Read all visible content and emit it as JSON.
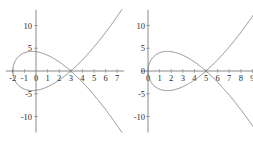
{
  "figure": {
    "background_color": "#ffffff",
    "curve_color": "#7a7a7a",
    "axis_color": "#8a8a8a",
    "label_color": "#2a2a2a"
  },
  "chart_data": [
    {
      "type": "line",
      "name": "left-plot",
      "title": "",
      "xlabel": "",
      "ylabel": "",
      "xlim": [
        -2.6,
        7.6
      ],
      "ylim": [
        -13.5,
        13.5
      ],
      "grid": false,
      "legend": false,
      "x_ticks": [
        -2,
        -1,
        0,
        1,
        2,
        3,
        4,
        5,
        6,
        7
      ],
      "x_tick_labels": [
        "-2",
        "-1",
        "0",
        "1",
        "2",
        "3",
        "4",
        "5",
        "6",
        "7"
      ],
      "y_ticks": [
        -10,
        -5,
        5,
        10
      ],
      "y_tick_labels": [
        "-10",
        "-5",
        "5",
        "10"
      ],
      "description": "nodal cubic y^2 = (x+2)(x-3)^2, loop between x=-2 and x=3, node at (3,0)",
      "curve_equation": "y^2 = (x + 2)(x - 3)^2",
      "loop_x_start": -2,
      "node_x": 3,
      "loop_y_max": 4.8,
      "loop_y_min": -4.8,
      "branch_x_end": 7,
      "series": [
        {
          "name": "upper-branch",
          "points_x": [
            -2,
            -1.5,
            -1,
            -0.5,
            0,
            0.5,
            1,
            1.5,
            2,
            2.5,
            3,
            3.5,
            4,
            4.5,
            5,
            5.5,
            6,
            6.5,
            7
          ],
          "points_y": [
            0,
            3.18,
            4.0,
            4.28,
            4.24,
            3.95,
            3.46,
            2.74,
            1.73,
            0.0,
            0.0,
            1.09,
            2.45,
            3.54,
            4.47,
            5.3,
            6.0,
            6.77,
            7.48
          ]
        },
        {
          "name": "lower-branch",
          "points_x": [
            -2,
            -1.5,
            -1,
            -0.5,
            0,
            0.5,
            1,
            1.5,
            2,
            2.5,
            3,
            3.5,
            4,
            4.5,
            5,
            5.5,
            6,
            6.5,
            7
          ],
          "points_y": [
            0,
            -3.18,
            -4.0,
            -4.28,
            -4.24,
            -3.95,
            -3.46,
            -2.74,
            -1.73,
            0.0,
            0.0,
            -1.09,
            -2.45,
            -3.54,
            -4.47,
            -5.3,
            -6.0,
            -6.77,
            -7.48
          ]
        }
      ]
    },
    {
      "type": "line",
      "name": "right-plot",
      "title": "",
      "xlabel": "",
      "ylabel": "",
      "xlim": [
        -0.6,
        9.6
      ],
      "ylim": [
        -13.5,
        13.5
      ],
      "grid": false,
      "legend": false,
      "x_ticks": [
        0,
        1,
        2,
        3,
        4,
        5,
        6,
        7,
        8,
        9
      ],
      "x_tick_labels": [
        "0",
        "1",
        "2",
        "3",
        "4",
        "5",
        "6",
        "7",
        "8",
        "9"
      ],
      "y_ticks": [
        -10,
        -5,
        0,
        5,
        10
      ],
      "y_tick_labels": [
        "-10",
        "-5",
        "0",
        "5",
        "10"
      ],
      "description": "nodal cubic y^2 = x(x-5)^2, loop between x=0 and x=5, node at (5,0)",
      "curve_equation": "y^2 = x(x - 5)^2",
      "loop_x_start": 0,
      "node_x": 5,
      "loop_y_max": 4.3,
      "loop_y_min": -4.3,
      "branch_x_end": 9,
      "series": [
        {
          "name": "upper-branch",
          "points_x": [
            0,
            0.5,
            1,
            1.5,
            2,
            2.5,
            3,
            3.5,
            4,
            4.5,
            5,
            5.5,
            6,
            6.5,
            7,
            7.5,
            8,
            8.5,
            9
          ],
          "points_y": [
            0,
            3.18,
            4.0,
            4.28,
            4.24,
            3.95,
            3.46,
            2.74,
            1.73,
            0.0,
            0.0,
            1.17,
            2.45,
            3.82,
            5.29,
            6.85,
            8.49,
            10.2,
            12.0
          ]
        },
        {
          "name": "lower-branch",
          "points_x": [
            0,
            0.5,
            1,
            1.5,
            2,
            2.5,
            3,
            3.5,
            4,
            4.5,
            5,
            5.5,
            6,
            6.5,
            7,
            7.5,
            8,
            8.5,
            9
          ],
          "points_y": [
            0,
            -3.18,
            -4.0,
            -4.28,
            -4.24,
            -3.95,
            -3.46,
            -2.74,
            -1.73,
            0.0,
            0.0,
            -1.17,
            -2.45,
            -3.82,
            -5.29,
            -6.85,
            -8.49,
            -10.2,
            -12.0
          ]
        }
      ]
    }
  ]
}
